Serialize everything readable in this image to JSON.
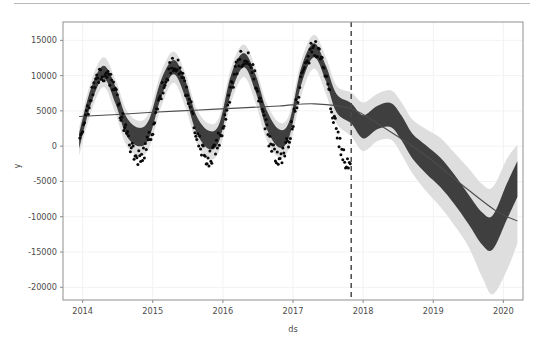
{
  "figure": {
    "background_color": "#ffffff",
    "plot_area": {
      "left": 63,
      "top": 14,
      "right": 523,
      "bottom": 292
    }
  },
  "divider": {
    "color": "#b9b9b9"
  },
  "chart_data": {
    "type": "line",
    "title": "",
    "xlabel": "ds",
    "ylabel": "y",
    "grid": true,
    "legend_position": "none",
    "xlim": [
      2013.72,
      2020.28
    ],
    "ylim": [
      -21800,
      17600
    ],
    "x_ticks": [
      "2014",
      "2015",
      "2016",
      "2017",
      "2018",
      "2019",
      "2020"
    ],
    "x_tick_values": [
      2014,
      2015,
      2016,
      2017,
      2018,
      2019,
      2020
    ],
    "y_ticks": [
      "15000",
      "10000",
      "5000",
      "0",
      "-5000",
      "-10000",
      "-15000",
      "-20000"
    ],
    "y_tick_values": [
      15000,
      10000,
      5000,
      0,
      -5000,
      -10000,
      -15000,
      -20000
    ],
    "changepoint_marker": {
      "x": 2017.83,
      "style": "dashed",
      "color": "#4a4a4a",
      "label": "forecast start"
    },
    "colors": {
      "forecast_band": "#3f3f3f",
      "uncertainty_band": "#d9d9d9",
      "trend_line": "#4d4d4d",
      "observed_points": "#0a0a0a",
      "grid": "#f2f2f2",
      "axis": "#8a8a8a"
    },
    "series": [
      {
        "name": "yhat_upper_outer",
        "type": "uncertainty-upper",
        "x": [
          2013.95,
          2014.12,
          2014.3,
          2014.47,
          2014.62,
          2014.8,
          2014.95,
          2015.12,
          2015.3,
          2015.47,
          2015.62,
          2015.8,
          2015.95,
          2016.12,
          2016.3,
          2016.47,
          2016.62,
          2016.8,
          2016.95,
          2017.12,
          2017.3,
          2017.47,
          2017.62,
          2017.83,
          2018.0,
          2018.2,
          2018.4,
          2018.55,
          2018.7,
          2018.9,
          2019.1,
          2019.3,
          2019.5,
          2019.7,
          2019.85,
          2020.05,
          2020.2
        ],
        "values": [
          2600,
          9200,
          12600,
          9400,
          5200,
          3600,
          4800,
          10500,
          13400,
          10200,
          5400,
          3200,
          4200,
          11200,
          14400,
          11000,
          6200,
          3400,
          4600,
          12200,
          15800,
          12600,
          8600,
          7600,
          6200,
          7400,
          7900,
          6200,
          3800,
          2400,
          1200,
          -900,
          -3100,
          -5400,
          -5800,
          -1800,
          200
        ]
      },
      {
        "name": "yhat_lower_outer",
        "type": "uncertainty-lower",
        "x": [
          2013.95,
          2014.12,
          2014.3,
          2014.47,
          2014.62,
          2014.8,
          2014.95,
          2015.12,
          2015.3,
          2015.47,
          2015.62,
          2015.8,
          2015.95,
          2016.12,
          2016.3,
          2016.47,
          2016.62,
          2016.8,
          2016.95,
          2017.12,
          2017.3,
          2017.47,
          2017.62,
          2017.83,
          2018.0,
          2018.2,
          2018.4,
          2018.55,
          2018.7,
          2018.9,
          2019.1,
          2019.3,
          2019.5,
          2019.7,
          2019.85,
          2020.05,
          2020.2
        ],
        "values": [
          -1400,
          4800,
          8400,
          4600,
          200,
          -1400,
          -200,
          5600,
          9000,
          5400,
          600,
          -1800,
          -600,
          6200,
          9800,
          6000,
          1000,
          -1600,
          -200,
          7200,
          11000,
          7400,
          3200,
          1400,
          -700,
          700,
          900,
          -1200,
          -3800,
          -6400,
          -8600,
          -11200,
          -14200,
          -18600,
          -21000,
          -17600,
          -13800
        ]
      },
      {
        "name": "yhat_upper_inner",
        "type": "forecast-band-upper",
        "x": [
          2013.95,
          2014.12,
          2014.3,
          2014.47,
          2014.62,
          2014.8,
          2014.95,
          2015.12,
          2015.3,
          2015.47,
          2015.62,
          2015.8,
          2015.95,
          2016.12,
          2016.3,
          2016.47,
          2016.62,
          2016.8,
          2016.95,
          2017.12,
          2017.3,
          2017.47,
          2017.62,
          2017.83,
          2018.0,
          2018.2,
          2018.4,
          2018.55,
          2018.7,
          2018.9,
          2019.1,
          2019.3,
          2019.5,
          2019.7,
          2019.85,
          2020.05,
          2020.2
        ],
        "values": [
          1800,
          8200,
          11400,
          8400,
          4200,
          2600,
          3800,
          9400,
          12200,
          9200,
          4400,
          2200,
          3200,
          10200,
          13200,
          10000,
          5200,
          2400,
          3600,
          11200,
          14600,
          11400,
          7400,
          6100,
          4400,
          5700,
          6100,
          4300,
          1800,
          100,
          -1600,
          -4000,
          -6800,
          -9400,
          -9800,
          -5300,
          -2100
        ]
      },
      {
        "name": "yhat_lower_inner",
        "type": "forecast-band-lower",
        "x": [
          2013.95,
          2014.12,
          2014.3,
          2014.47,
          2014.62,
          2014.8,
          2014.95,
          2015.12,
          2015.3,
          2015.47,
          2015.62,
          2015.8,
          2015.95,
          2016.12,
          2016.3,
          2016.47,
          2016.62,
          2016.8,
          2016.95,
          2017.12,
          2017.3,
          2017.47,
          2017.62,
          2017.83,
          2018.0,
          2018.2,
          2018.4,
          2018.55,
          2018.7,
          2018.9,
          2019.1,
          2019.3,
          2019.5,
          2019.7,
          2019.85,
          2020.05,
          2020.2
        ],
        "values": [
          -400,
          6000,
          9600,
          6000,
          1600,
          0,
          1200,
          7000,
          10200,
          6800,
          2000,
          -400,
          800,
          7600,
          11200,
          7600,
          2600,
          -200,
          1400,
          8800,
          12600,
          9200,
          4800,
          3200,
          1100,
          2400,
          2700,
          800,
          -1700,
          -3900,
          -5800,
          -8200,
          -11000,
          -14000,
          -14600,
          -10400,
          -7200
        ]
      },
      {
        "name": "trend",
        "type": "trend-line",
        "x": [
          2013.95,
          2014.5,
          2015.0,
          2015.6,
          2016.2,
          2016.8,
          2017.3,
          2017.83,
          2018.3,
          2018.9,
          2019.4,
          2019.9,
          2020.2
        ],
        "values": [
          4200,
          4500,
          4800,
          5100,
          5400,
          5700,
          6000,
          5300,
          2600,
          -1400,
          -5400,
          -9200,
          -10600
        ]
      },
      {
        "name": "observed",
        "type": "scatter",
        "note": "black dots: weekly observations, seasonal sinusoid amplitude ~6000 around trend, visible 2014-01 through 2017-10"
      }
    ],
    "seasonal_peaks": [
      {
        "x": 2014.3,
        "value": 11000
      },
      {
        "x": 2015.3,
        "value": 12000
      },
      {
        "x": 2016.3,
        "value": 13000
      },
      {
        "x": 2017.3,
        "value": 15000
      }
    ],
    "seasonal_troughs": [
      {
        "x": 2014.8,
        "value": 1200
      },
      {
        "x": 2015.8,
        "value": 600
      },
      {
        "x": 2016.8,
        "value": 800
      }
    ]
  }
}
